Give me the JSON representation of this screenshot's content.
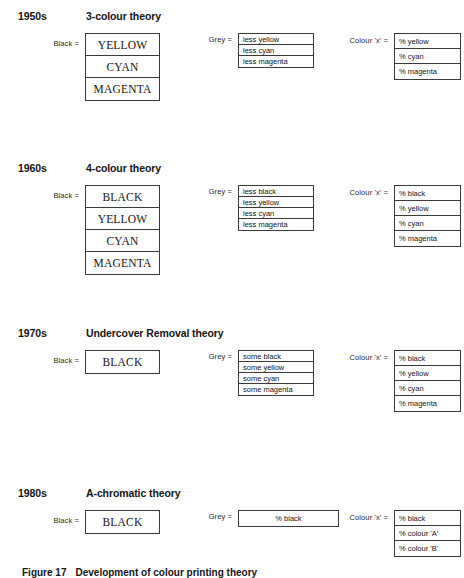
{
  "figure": {
    "caption_number": "Figure 17",
    "caption_text": "Development of colour printing theory"
  },
  "column_labels": {
    "black": "Black  =",
    "grey": "Grey  =",
    "colour": "Colour 'x'  ="
  },
  "sections": [
    {
      "decade": "1950s",
      "theory": "3-colour theory",
      "black": [
        "YELLOW",
        "CYAN",
        "MAGENTA"
      ],
      "grey": [
        "less yellow",
        "less cyan",
        "less magenta"
      ],
      "colour": [
        "% yellow",
        "% cyan",
        "% magenta"
      ]
    },
    {
      "decade": "1960s",
      "theory": "4-colour theory",
      "black": [
        "BLACK",
        "YELLOW",
        "CYAN",
        "MAGENTA"
      ],
      "grey": [
        "less black",
        "less yellow",
        "less cyan",
        "less magenta"
      ],
      "colour": [
        "% black",
        "% yellow",
        "% cyan",
        "% magenta"
      ]
    },
    {
      "decade": "1970s",
      "theory": "Undercover Removal theory",
      "black": [
        "BLACK"
      ],
      "grey": [
        "some black",
        "some yellow",
        "some cyan",
        "some magenta"
      ],
      "colour": [
        "% black",
        "% yellow",
        "% cyan",
        "% magenta"
      ]
    },
    {
      "decade": "1980s",
      "theory": "A-chromatic theory",
      "black": [
        "BLACK"
      ],
      "grey": [
        "% black"
      ],
      "colour": [
        "% black",
        "% colour 'A'",
        "% colour 'B'"
      ]
    }
  ]
}
